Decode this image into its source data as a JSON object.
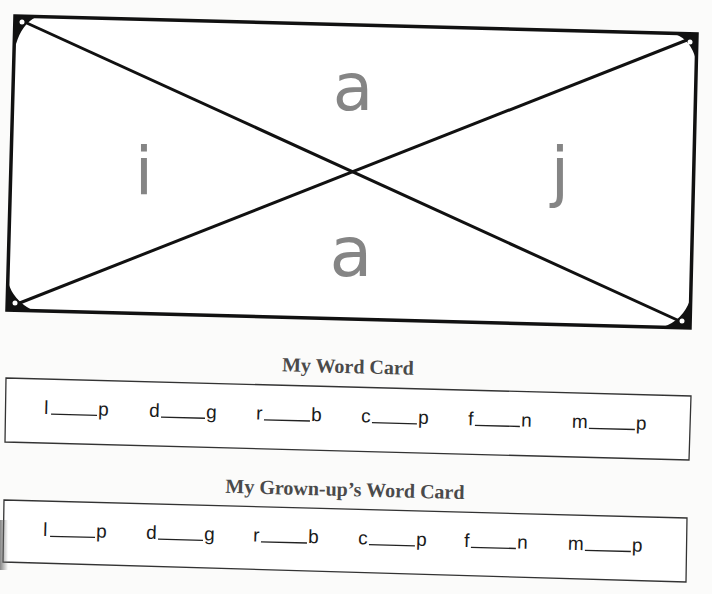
{
  "sort_card": {
    "letters": {
      "top": "a",
      "bottom": "a",
      "left": "i",
      "right": "j"
    },
    "letter_color": "#858585",
    "border_color": "#111111"
  },
  "my_word_card": {
    "title": "My Word Card",
    "words": [
      {
        "start": "l",
        "end": "p"
      },
      {
        "start": "d",
        "end": "g"
      },
      {
        "start": "r",
        "end": "b"
      },
      {
        "start": "c",
        "end": "p"
      },
      {
        "start": "f",
        "end": "n"
      },
      {
        "start": "m",
        "end": "p"
      }
    ]
  },
  "grownup_word_card": {
    "title": "My Grown-up’s Word Card",
    "words": [
      {
        "start": "l",
        "end": "p"
      },
      {
        "start": "d",
        "end": "g"
      },
      {
        "start": "r",
        "end": "b"
      },
      {
        "start": "c",
        "end": "p"
      },
      {
        "start": "f",
        "end": "n"
      },
      {
        "start": "m",
        "end": "p"
      }
    ]
  }
}
